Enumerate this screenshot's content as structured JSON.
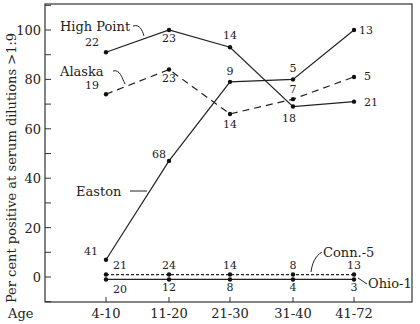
{
  "chart_data": {
    "type": "line",
    "title": "",
    "xlabel": "Age",
    "ylabel": "Per cent positive at serum dilutions >1:9",
    "categories": [
      "4-10",
      "11-20",
      "21-30",
      "31-40",
      "41-72"
    ],
    "yticks": [
      0,
      20,
      40,
      60,
      80,
      100
    ],
    "ylim": [
      -10,
      110
    ],
    "grid": false,
    "legend_position": "inline labels",
    "series": [
      {
        "name": "High Point",
        "style": "solid",
        "values": [
          91,
          100,
          93,
          69,
          71
        ],
        "point_labels": [
          "22",
          "23",
          "14",
          "18",
          "21"
        ]
      },
      {
        "name": "Alaska",
        "style": "dashed",
        "values": [
          74,
          84,
          66,
          72,
          81
        ],
        "point_labels": [
          "19",
          "23",
          "14",
          "7",
          "5"
        ]
      },
      {
        "name": "Easton",
        "style": "solid",
        "values": [
          7,
          47,
          79,
          80,
          100
        ],
        "point_labels": [
          "41",
          "68",
          "9",
          "5",
          "13"
        ]
      },
      {
        "name": "Conn.-5",
        "style": "dotted",
        "values": [
          1,
          1,
          1,
          1,
          1
        ],
        "point_labels": [
          "21",
          "24",
          "14",
          "8",
          "13"
        ]
      },
      {
        "name": "Ohio-1",
        "style": "solid",
        "values": [
          -1,
          -1,
          -1,
          -1,
          -1
        ],
        "point_labels": [
          "20",
          "12",
          "8",
          "4",
          "3"
        ]
      }
    ]
  }
}
